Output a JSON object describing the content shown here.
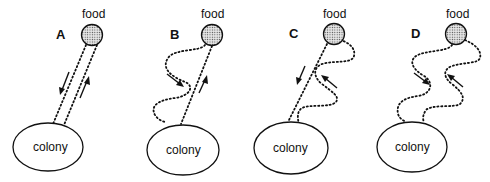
{
  "figure": {
    "food_label": "food",
    "colony_label": "colony",
    "panels": [
      {
        "id": "A",
        "label": "A",
        "outbound": "straight",
        "return": "straight"
      },
      {
        "id": "B",
        "label": "B",
        "outbound": "winding",
        "return": "straight"
      },
      {
        "id": "C",
        "label": "C",
        "outbound": "winding",
        "return": "straight"
      },
      {
        "id": "D",
        "label": "D",
        "outbound": "winding",
        "return": "winding"
      }
    ]
  },
  "colors": {
    "line": "#111111",
    "food_fill": "#cfcfcf",
    "background": "#ffffff"
  }
}
